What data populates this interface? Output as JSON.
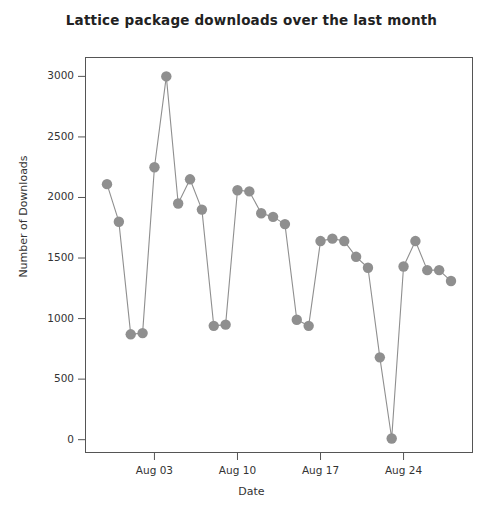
{
  "chart_data": {
    "type": "line",
    "title": "Lattice package downloads over the last month",
    "xlabel": "Date",
    "ylabel": "Number of Downloads",
    "x": [
      "Jul 30",
      "Jul 31",
      "Aug 01",
      "Aug 02",
      "Aug 03",
      "Aug 04",
      "Aug 05",
      "Aug 06",
      "Aug 07",
      "Aug 08",
      "Aug 09",
      "Aug 10",
      "Aug 11",
      "Aug 12",
      "Aug 13",
      "Aug 14",
      "Aug 15",
      "Aug 16",
      "Aug 17",
      "Aug 18",
      "Aug 19",
      "Aug 20",
      "Aug 21",
      "Aug 22",
      "Aug 23",
      "Aug 24",
      "Aug 25",
      "Aug 26",
      "Aug 27",
      "Aug 28"
    ],
    "values": [
      2110,
      1800,
      870,
      880,
      2250,
      3000,
      1950,
      2150,
      1900,
      940,
      950,
      2060,
      2050,
      1870,
      1840,
      1780,
      990,
      940,
      1640,
      1660,
      1640,
      1510,
      1420,
      680,
      10,
      1430,
      1640,
      1400,
      1400,
      1310
    ],
    "xtick_labels": [
      "Aug 03",
      "Aug 10",
      "Aug 17",
      "Aug 24"
    ],
    "xtick_indices": [
      4,
      11,
      18,
      25
    ],
    "ytick_values": [
      0,
      500,
      1000,
      1500,
      2000,
      2500,
      3000
    ],
    "ytick_labels": [
      "0",
      "500",
      "1000",
      "1500",
      "2000",
      "2500",
      "3000"
    ],
    "ylim": [
      -110,
      3160
    ],
    "grid": false,
    "legend": false,
    "marker": "filled-circle",
    "marker_color": "#8f8f8f",
    "line_color": "#8f8f8f",
    "axis_color": "#555555",
    "title_color": "#222222"
  }
}
